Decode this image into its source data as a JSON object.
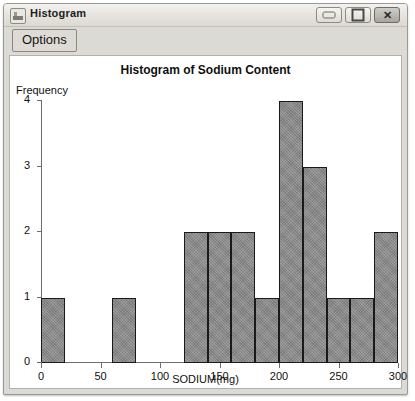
{
  "window": {
    "title": "Histogram",
    "icon": "histogram-window-icon",
    "controls": {
      "minimize": "─",
      "maximize": "□",
      "close": "✕"
    }
  },
  "toolbar": {
    "options_label": "Options"
  },
  "chart_data": {
    "type": "bar",
    "title": "Histogram of Sodium Content",
    "xlabel": "SODIUM(mg)",
    "ylabel": "Frequency",
    "xlim": [
      0,
      300
    ],
    "ylim": [
      0,
      4
    ],
    "grid": false,
    "legend": null,
    "bin_width": 20,
    "x_ticks": [
      0,
      50,
      100,
      150,
      200,
      250,
      300
    ],
    "y_ticks": [
      0,
      1,
      2,
      3,
      4
    ],
    "bins": [
      {
        "start": 0,
        "end": 20,
        "count": 1
      },
      {
        "start": 20,
        "end": 40,
        "count": 0
      },
      {
        "start": 40,
        "end": 60,
        "count": 0
      },
      {
        "start": 60,
        "end": 80,
        "count": 1
      },
      {
        "start": 80,
        "end": 100,
        "count": 0
      },
      {
        "start": 100,
        "end": 120,
        "count": 0
      },
      {
        "start": 120,
        "end": 140,
        "count": 2
      },
      {
        "start": 140,
        "end": 160,
        "count": 2
      },
      {
        "start": 160,
        "end": 180,
        "count": 2
      },
      {
        "start": 180,
        "end": 200,
        "count": 1
      },
      {
        "start": 200,
        "end": 220,
        "count": 4
      },
      {
        "start": 220,
        "end": 240,
        "count": 3
      },
      {
        "start": 240,
        "end": 260,
        "count": 1
      },
      {
        "start": 260,
        "end": 280,
        "count": 1
      },
      {
        "start": 280,
        "end": 300,
        "count": 2
      }
    ],
    "colors": {
      "bar_fill": "#8a8a8a",
      "bar_border": "#1a1a1a",
      "axis": "#6e6e6e",
      "plot_background": "#ffffff"
    }
  }
}
